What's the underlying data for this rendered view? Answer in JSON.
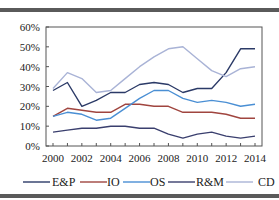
{
  "chart_data": {
    "type": "line",
    "title": "",
    "xlabel": "",
    "ylabel": "",
    "x": [
      2000,
      2001,
      2002,
      2003,
      2004,
      2005,
      2006,
      2007,
      2008,
      2009,
      2010,
      2011,
      2012,
      2013,
      2014
    ],
    "x_tick_labels": [
      "2000",
      "2002",
      "2004",
      "2006",
      "2008",
      "2010",
      "2012",
      "2014"
    ],
    "y_tick_labels": [
      "0%",
      "10%",
      "20%",
      "30%",
      "40%",
      "50%",
      "60%"
    ],
    "ylim": [
      0,
      60
    ],
    "grid": false,
    "legend_position": "bottom",
    "series": [
      {
        "name": "E&P",
        "color": "#2b3a67",
        "values": [
          28,
          32,
          20,
          23,
          27,
          27,
          31,
          32,
          31,
          27,
          29,
          29,
          37,
          49,
          49
        ]
      },
      {
        "name": "IO",
        "color": "#a0453f",
        "values": [
          15,
          19,
          18,
          17,
          17,
          21,
          21,
          20,
          20,
          17,
          17,
          17,
          16,
          14,
          14
        ]
      },
      {
        "name": "OS",
        "color": "#4a8fd4",
        "values": [
          15,
          17,
          16,
          13,
          14,
          19,
          24,
          28,
          28,
          24,
          22,
          23,
          22,
          20,
          21
        ]
      },
      {
        "name": "R&M",
        "color": "#3a3f6e",
        "values": [
          7,
          8,
          9,
          9,
          10,
          10,
          9,
          9,
          6,
          4,
          6,
          7,
          5,
          4,
          5
        ]
      },
      {
        "name": "CD",
        "color": "#a9b3d6",
        "values": [
          29,
          37,
          34,
          27,
          28,
          34,
          40,
          45,
          49,
          50,
          44,
          38,
          35,
          39,
          40
        ]
      }
    ]
  }
}
